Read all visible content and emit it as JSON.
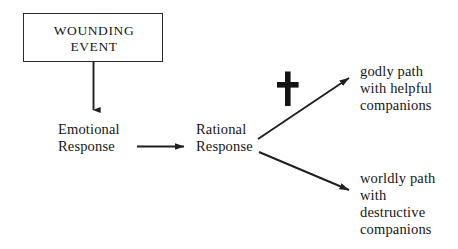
{
  "diagram": {
    "type": "flowchart",
    "background_color": "#ffffff",
    "stroke_color": "#1f1f1f",
    "text_color": "#161616",
    "nodes": {
      "wounding_event": {
        "label": "WOUNDING\nEVENT",
        "shape": "rectangle"
      },
      "emotional_response": {
        "label": "Emotional\nResponse",
        "shape": "text"
      },
      "rational_response": {
        "label": "Rational\nResponse",
        "shape": "text"
      },
      "godly_path": {
        "label": "godly path\nwith helpful\ncompanions",
        "shape": "text"
      },
      "worldly_path": {
        "label": "worldly path\nwith\ndestructive\ncompanions",
        "shape": "text"
      }
    },
    "symbols": {
      "cross": {
        "name": "christian-cross-icon",
        "description": "Latin cross placed above the upward branch arrow"
      }
    },
    "edges": [
      {
        "id": "edge-wounding-to-emotional",
        "from": "wounding_event",
        "to": "emotional_response",
        "direction": "down",
        "arrowhead": true
      },
      {
        "id": "edge-emotional-to-rational",
        "from": "emotional_response",
        "to": "rational_response",
        "direction": "right",
        "arrowhead": true
      },
      {
        "id": "edge-rational-to-godly",
        "from": "rational_response",
        "to": "godly_path",
        "direction": "up-right",
        "arrowhead": true
      },
      {
        "id": "edge-rational-to-worldly",
        "from": "rational_response",
        "to": "worldly_path",
        "direction": "down-right",
        "arrowhead": true
      }
    ]
  }
}
